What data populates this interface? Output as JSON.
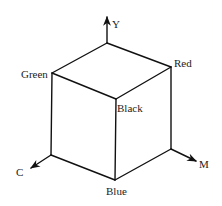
{
  "diagram": {
    "axes": [
      {
        "id": "Y",
        "label": "Y"
      },
      {
        "id": "C",
        "label": "C"
      },
      {
        "id": "M",
        "label": "M"
      }
    ],
    "vertices": {
      "green": "Green",
      "red": "Red",
      "black": "Black",
      "blue": "Blue"
    },
    "colors": {
      "line": "#111111",
      "text": "#222222",
      "background": "#ffffff"
    }
  }
}
